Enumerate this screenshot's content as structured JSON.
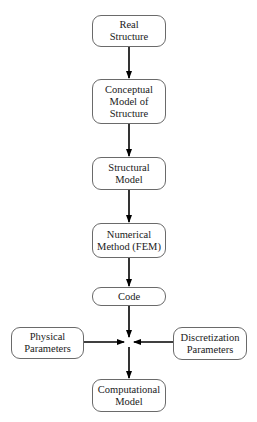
{
  "diagram": {
    "type": "flowchart",
    "nodes": [
      {
        "id": "real-structure",
        "label": "Real\nStructure"
      },
      {
        "id": "conceptual-model",
        "label": "Conceptual\nModel of\nStructure"
      },
      {
        "id": "structural-model",
        "label": "Structural\nModel"
      },
      {
        "id": "numerical-method",
        "label": "Numerical\nMethod (FEM)"
      },
      {
        "id": "code",
        "label": "Code"
      },
      {
        "id": "physical-parameters",
        "label": "Physical\nParameters"
      },
      {
        "id": "discretization-parameters",
        "label": "Discretization\nParameters"
      },
      {
        "id": "computational-model",
        "label": "Computational\nModel"
      }
    ],
    "edges": [
      {
        "from": "real-structure",
        "to": "conceptual-model"
      },
      {
        "from": "conceptual-model",
        "to": "structural-model"
      },
      {
        "from": "structural-model",
        "to": "numerical-method"
      },
      {
        "from": "numerical-method",
        "to": "code"
      },
      {
        "from": "code",
        "to": "junction"
      },
      {
        "from": "physical-parameters",
        "to": "junction"
      },
      {
        "from": "discretization-parameters",
        "to": "junction"
      },
      {
        "from": "junction",
        "to": "computational-model"
      }
    ]
  }
}
